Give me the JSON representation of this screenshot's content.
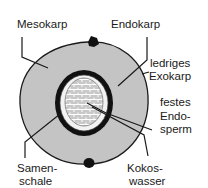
{
  "diagram": {
    "type": "cross-section",
    "labels": {
      "mesokarp": "Mesokarp",
      "endokarp": "Endokarp",
      "exokarp_1": "ledriges",
      "exokarp_2": "Exokarp",
      "endosperm_1": "festes",
      "endosperm_2": "Endo-",
      "endosperm_3": "sperm",
      "samenschale_1": "Samen-",
      "samenschale_2": "schale",
      "kokoswasser_1": "Kokos-",
      "kokoswasser_2": "wasser"
    },
    "colors": {
      "mesokarp": "#c4c4c4",
      "endokarp": "#111111",
      "samenschale": "#f2f2f2",
      "endosperm": "#bdbdbd",
      "lines": "#1a1a1a"
    }
  }
}
